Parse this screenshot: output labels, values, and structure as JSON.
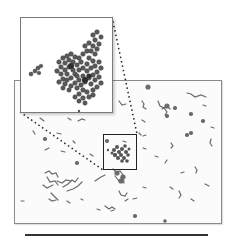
{
  "figure": {
    "main_panel": {
      "x": 14,
      "y": 80,
      "width": 208,
      "height": 144
    },
    "inset_panel": {
      "x": 20,
      "y": 17,
      "width": 93,
      "height": 96
    },
    "selection_box": {
      "x": 103,
      "y": 134,
      "width": 34,
      "height": 36
    },
    "scale_bar": {
      "x1": 25,
      "x2": 208,
      "y": 235
    },
    "colors": {
      "particles": "#5a5a5a",
      "frame": "#8a8a8a",
      "selection": "#222222",
      "connector": "#222222",
      "scale_bar": "#333333"
    }
  }
}
